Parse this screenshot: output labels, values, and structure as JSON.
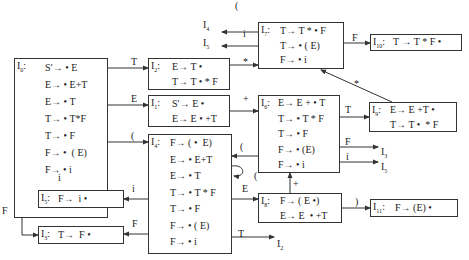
{
  "diagram": {
    "type": "LR(0) item-set automaton (DFA)",
    "states": [
      {
        "id": "I0",
        "label": "I",
        "sub": "0",
        "x": 14,
        "y": 58,
        "w": 94,
        "h": 160,
        "items": [
          "S′→ • E",
          "E→ • E+T",
          "E→ • T",
          "T→ • T*F",
          "T→ • F",
          "F→ •  ( E)",
          "F→ • i"
        ],
        "item_x": 45,
        "item_y": 62,
        "item_dy": 17
      },
      {
        "id": "I1",
        "label": "I",
        "sub": "1",
        "x": 148,
        "y": 95,
        "w": 82,
        "h": 32,
        "items": [
          "S′→ E •",
          "E→ E • +T"
        ],
        "item_x": 172,
        "item_y": 98,
        "item_dy": 15
      },
      {
        "id": "I2",
        "label": "I",
        "sub": "2",
        "x": 148,
        "y": 58,
        "w": 82,
        "h": 32,
        "items": [
          "E→ T •",
          "T→ T • * F"
        ],
        "item_x": 172,
        "item_y": 61,
        "item_dy": 15
      },
      {
        "id": "I3",
        "label": "I",
        "sub": "3",
        "x": 38,
        "y": 226,
        "w": 86,
        "h": 18,
        "items": [
          "T→  F •"
        ],
        "item_x": 58,
        "item_y": 229,
        "item_dy": 15
      },
      {
        "id": "I4",
        "label": "I",
        "sub": "4",
        "x": 148,
        "y": 134,
        "w": 84,
        "h": 120,
        "items": [
          "F→ ( •  E)",
          "E→ • E+T",
          "E→ • T",
          "T→ • T * F",
          "T→ • F",
          "F→ • ( E)",
          "F→ • i"
        ],
        "item_x": 170,
        "item_y": 137,
        "item_dy": 16.5
      },
      {
        "id": "I5",
        "label": "I",
        "sub": "5",
        "x": 38,
        "y": 190,
        "w": 86,
        "h": 18,
        "items": [
          "F→  i •"
        ],
        "item_x": 58,
        "item_y": 193,
        "item_dy": 15
      },
      {
        "id": "I6",
        "label": "I",
        "sub": "6",
        "x": 258,
        "y": 95,
        "w": 82,
        "h": 78,
        "items": [
          "E→ E + • T",
          "T→ • T * F",
          "T→ • F",
          "F→ • (E)",
          "F→ • i"
        ],
        "item_x": 278,
        "item_y": 97,
        "item_dy": 15.5
      },
      {
        "id": "I7",
        "label": "I",
        "sub": "7",
        "x": 258,
        "y": 22,
        "w": 86,
        "h": 47,
        "items": [
          "T→ T * • F",
          "T→ • ( E)",
          "F→ • i"
        ],
        "item_x": 280,
        "item_y": 25,
        "item_dy": 14.5
      },
      {
        "id": "I8",
        "label": "I",
        "sub": "8",
        "x": 258,
        "y": 193,
        "w": 84,
        "h": 30,
        "items": [
          "F→ ( E •)",
          "E→ E  • +T"
        ],
        "item_x": 280,
        "item_y": 195,
        "item_dy": 15
      },
      {
        "id": "I9",
        "label": "I",
        "sub": "9",
        "x": 369,
        "y": 102,
        "w": 88,
        "h": 30,
        "items": [
          "E→ E +T •",
          "T→ T •  * F"
        ],
        "item_x": 390,
        "item_y": 104,
        "item_dy": 14.5
      },
      {
        "id": "I10",
        "label": "I",
        "sub": "10",
        "x": 370,
        "y": 34,
        "w": 92,
        "h": 17,
        "items": [
          "T → T * F •"
        ],
        "item_x": 393,
        "item_y": 36,
        "item_dy": 15
      },
      {
        "id": "I11",
        "label": "I",
        "sub": "11",
        "x": 370,
        "y": 199,
        "w": 88,
        "h": 18,
        "items": [
          "F→ (E) •"
        ],
        "item_x": 395,
        "item_y": 202,
        "item_dy": 15
      }
    ],
    "transitions": [
      {
        "from": "I0",
        "to": "I2",
        "symbol": "T"
      },
      {
        "from": "I0",
        "to": "I1",
        "symbol": "E"
      },
      {
        "from": "I0",
        "to": "I4",
        "symbol": "("
      },
      {
        "from": "I0",
        "to": "I5",
        "symbol": "i"
      },
      {
        "from": "I0",
        "to": "I3",
        "symbol": "F"
      },
      {
        "from": "I1",
        "to": "I6",
        "symbol": "+"
      },
      {
        "from": "I2",
        "to": "I7",
        "symbol": "*"
      },
      {
        "from": "I4",
        "to": "I8",
        "symbol": "E"
      },
      {
        "from": "I4",
        "to": "I4",
        "symbol": "("
      },
      {
        "from": "I4",
        "to": "I5",
        "symbol": "i"
      },
      {
        "from": "I4",
        "to": "I3",
        "symbol": "F"
      },
      {
        "from": "I4",
        "to": "I2",
        "symbol": "T"
      },
      {
        "from": "I6",
        "to": "I9",
        "symbol": "T"
      },
      {
        "from": "I6",
        "to": "I4",
        "symbol": "("
      },
      {
        "from": "I6",
        "to": "I3",
        "symbol": "F"
      },
      {
        "from": "I6",
        "to": "I5",
        "symbol": "i"
      },
      {
        "from": "I7",
        "to": "I10",
        "symbol": "F"
      },
      {
        "from": "I7",
        "to": "I4",
        "symbol": "("
      },
      {
        "from": "I7",
        "to": "I5",
        "symbol": "i"
      },
      {
        "from": "I8",
        "to": "I11",
        "symbol": ")"
      },
      {
        "from": "I8",
        "to": "I6",
        "symbol": "+"
      },
      {
        "from": "I9",
        "to": "I7",
        "symbol": "*"
      }
    ],
    "edge_labels": [
      {
        "text": "T",
        "x": 131,
        "y": 56
      },
      {
        "text": "E",
        "x": 131,
        "y": 93
      },
      {
        "text": "(",
        "x": 131,
        "y": 130
      },
      {
        "text": "i",
        "x": 58,
        "y": 172
      },
      {
        "text": "F",
        "x": 2,
        "y": 205
      },
      {
        "text": "+",
        "x": 243,
        "y": 93
      },
      {
        "text": "*",
        "x": 243,
        "y": 56
      },
      {
        "text": "(",
        "x": 235,
        "y": 0
      },
      {
        "text": "i",
        "x": 243,
        "y": 28
      },
      {
        "text": "F",
        "x": 352,
        "y": 32
      },
      {
        "text": "*",
        "x": 354,
        "y": 78
      },
      {
        "text": "T",
        "x": 345,
        "y": 104
      },
      {
        "text": "F",
        "x": 345,
        "y": 136
      },
      {
        "text": "i",
        "x": 346,
        "y": 151
      },
      {
        "text": "(",
        "x": 240,
        "y": 141
      },
      {
        "text": "(",
        "x": 254,
        "y": 170
      },
      {
        "text": "E",
        "x": 242,
        "y": 183
      },
      {
        "text": "+",
        "x": 293,
        "y": 178
      },
      {
        "text": "i",
        "x": 132,
        "y": 183
      },
      {
        "text": "F",
        "x": 132,
        "y": 218
      },
      {
        "text": "T",
        "x": 238,
        "y": 228
      },
      {
        "text": ")",
        "x": 355,
        "y": 196
      }
    ],
    "dangling_targets": [
      {
        "text": "I",
        "sub": "4",
        "x": 203,
        "y": 19
      },
      {
        "text": "I",
        "sub": "5",
        "x": 203,
        "y": 37
      },
      {
        "text": "I",
        "sub": "3",
        "x": 381,
        "y": 146
      },
      {
        "text": "I",
        "sub": "5",
        "x": 381,
        "y": 161
      },
      {
        "text": "I",
        "sub": "2",
        "x": 277,
        "y": 238
      }
    ]
  }
}
